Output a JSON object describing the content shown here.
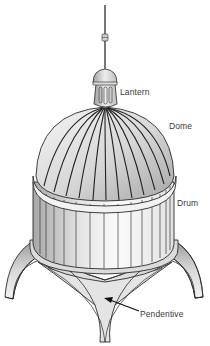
{
  "diagram": {
    "labels": {
      "lantern": "Lantern",
      "dome": "Dome",
      "drum": "Drum",
      "pendentive": "Pendentive"
    },
    "colors": {
      "outline": "#2a2a2a",
      "shade_dark": "#9c9c9c",
      "shade_mid": "#c8c8c8",
      "shade_light": "#efefef",
      "label_text": "#3a3a3a"
    }
  }
}
